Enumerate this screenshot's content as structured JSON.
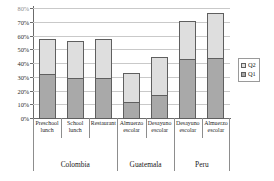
{
  "chart_data": {
    "type": "bar",
    "subtype": "stacked-vertical",
    "title": "",
    "subtitle": "",
    "xlabel": "",
    "ylabel": "",
    "ylim": [
      0,
      80
    ],
    "ytick_values": [
      0,
      10,
      20,
      30,
      40,
      50,
      60,
      70,
      80
    ],
    "ytick_labels": [
      "0%",
      "10%",
      "20%",
      "30%",
      "40%",
      "50%",
      "60%",
      "70%",
      "80%"
    ],
    "ytick_label_clipped_top": true,
    "grid": true,
    "grid_axis": "y",
    "legend_position": "right",
    "value_unit": "percent",
    "categories": [
      "Preschool lunch",
      "School lunch",
      "Restaurant",
      "Almuerzo escolar",
      "Desayuno escolar",
      "Desayuno escolar",
      "Almuerzo escolar"
    ],
    "category_lines": [
      [
        "Preschool",
        "lunch"
      ],
      [
        "School",
        "lunch"
      ],
      [
        "Restaurant",
        ""
      ],
      [
        "Almuerzo",
        "escolar"
      ],
      [
        "Desayuno",
        "escolar"
      ],
      [
        "Desayuno",
        "escolar"
      ],
      [
        "Almuerzo",
        "escolar"
      ]
    ],
    "groups": [
      {
        "label": "Colombia",
        "categories": [
          "Preschool lunch",
          "School lunch",
          "Restaurant"
        ]
      },
      {
        "label": "Guatemala",
        "categories": [
          "Almuerzo escolar",
          "Desayuno escolar"
        ]
      },
      {
        "label": "Peru",
        "categories": [
          "Desayuno escolar",
          "Almuerzo escolar"
        ]
      }
    ],
    "series": [
      {
        "name": "Q1",
        "color": "#a9a9a9",
        "values": [
          33,
          30,
          29.5,
          12.5,
          17.5,
          44,
          44.5
        ]
      },
      {
        "name": "Q2",
        "color": "#dedede",
        "values": [
          25,
          26.5,
          28.5,
          21,
          27.5,
          27,
          32.5
        ]
      }
    ],
    "totals": [
      58,
      56.5,
      58,
      33.5,
      45,
      71,
      77
    ],
    "bars": [
      {
        "category": "Preschool lunch",
        "group": "Colombia",
        "q1": 33,
        "q2": 25,
        "total": 58
      },
      {
        "category": "School lunch",
        "group": "Colombia",
        "q1": 30,
        "q2": 26.5,
        "total": 56.5
      },
      {
        "category": "Restaurant",
        "group": "Colombia",
        "q1": 29.5,
        "q2": 28.5,
        "total": 58
      },
      {
        "category": "Almuerzo escolar",
        "group": "Guatemala",
        "q1": 12.5,
        "q2": 21,
        "total": 33.5
      },
      {
        "category": "Desayuno escolar",
        "group": "Guatemala",
        "q1": 17.5,
        "q2": 27.5,
        "total": 45
      },
      {
        "category": "Desayuno escolar",
        "group": "Peru",
        "q1": 44,
        "q2": 27,
        "total": 71
      },
      {
        "category": "Almuerzo escolar",
        "group": "Peru",
        "q1": 44.5,
        "q2": 32.5,
        "total": 77
      }
    ]
  },
  "legend": {
    "entries": [
      {
        "label": "Q2",
        "color": "#dedede"
      },
      {
        "label": "Q1",
        "color": "#a9a9a9"
      }
    ]
  },
  "colors": {
    "q1": "#a9a9a9",
    "q2": "#dedede",
    "bar_outline": "#5f5f5f",
    "gridline": "#c9c9c9",
    "axis": "#6b6b6b",
    "background": "#ffffff"
  }
}
